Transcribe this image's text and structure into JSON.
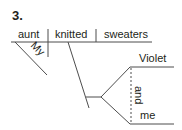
{
  "exercise": {
    "number": "3."
  },
  "diagram": {
    "type": "sentence-diagram",
    "subject": "aunt",
    "subject_modifier": "My",
    "verb": "knitted",
    "direct_object": "sweaters",
    "indirect_object": {
      "conjunction": "and",
      "items": [
        "Violet",
        "me"
      ]
    }
  }
}
